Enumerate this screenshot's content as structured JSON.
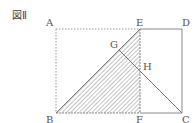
{
  "figure": {
    "title": "図Ⅱ",
    "points": {
      "A": {
        "label": "A",
        "x": 56,
        "y": 29
      },
      "E": {
        "label": "E",
        "x": 140,
        "y": 29
      },
      "D": {
        "label": "D",
        "x": 182,
        "y": 29
      },
      "B": {
        "label": "B",
        "x": 56,
        "y": 113
      },
      "F": {
        "label": "F",
        "x": 140,
        "y": 113
      },
      "C": {
        "label": "C",
        "x": 182,
        "y": 113
      },
      "G": {
        "label": "G",
        "x": 119,
        "y": 50
      },
      "H": {
        "label": "H",
        "x": 140,
        "y": 71
      }
    },
    "shaded_region": [
      "B",
      "E",
      "F"
    ],
    "colors": {
      "line": "#888888",
      "dotted": "#999999",
      "hatch": "#888888",
      "label": "#555555"
    }
  }
}
